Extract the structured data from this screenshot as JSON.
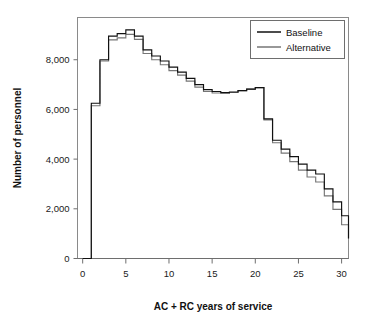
{
  "figure": {
    "clipped_title_fragment": "",
    "background_color": "#ffffff"
  },
  "colors": {
    "baseline": "#111111",
    "alternative": "#767676",
    "axis": "#6e6e6e",
    "frame": "#8a8a8a",
    "text": "#111111"
  },
  "legend": {
    "position": "top-right",
    "entries": [
      {
        "label": "Baseline",
        "color": "#111111"
      },
      {
        "label": "Alternative",
        "color": "#767676"
      }
    ]
  },
  "axes": {
    "x": {
      "label": "AC + RC years of service",
      "ticks": [
        0,
        5,
        10,
        15,
        20,
        25,
        30
      ],
      "tick_labels": [
        "0",
        "5",
        "10",
        "15",
        "20",
        "25",
        "30"
      ],
      "range": [
        -0.6,
        30.8
      ]
    },
    "y": {
      "label": "Number of personnel",
      "ticks": [
        0,
        2000,
        4000,
        6000,
        8000
      ],
      "tick_labels": [
        "0",
        "2,000",
        "4,000",
        "6,000",
        "8,000"
      ],
      "range": [
        0,
        9700
      ]
    }
  },
  "chart_data": {
    "type": "line",
    "style": "step",
    "title": "",
    "xlabel": "AC + RC years of service",
    "ylabel": "Number of personnel",
    "xlim": [
      -0.6,
      30.8
    ],
    "ylim": [
      0,
      9700
    ],
    "grid": false,
    "legend_position": "top-right",
    "x": [
      0,
      1,
      2,
      3,
      4,
      5,
      6,
      7,
      8,
      9,
      10,
      11,
      12,
      13,
      14,
      15,
      16,
      17,
      18,
      19,
      20,
      21,
      22,
      23,
      24,
      25,
      26,
      27,
      28,
      29,
      30
    ],
    "xtick_interval": 1,
    "series": [
      {
        "name": "Baseline",
        "color": "#111111",
        "values": [
          0,
          6250,
          8000,
          8950,
          9050,
          9200,
          8950,
          8400,
          8150,
          7950,
          7700,
          7500,
          7250,
          7000,
          6800,
          6720,
          6680,
          6700,
          6760,
          6820,
          6880,
          5620,
          4760,
          4400,
          4100,
          3800,
          3560,
          3400,
          2800,
          2280,
          1720
        ]
      },
      {
        "name": "Alternative",
        "color": "#767676",
        "values": [
          0,
          6150,
          7950,
          8800,
          8880,
          9020,
          8820,
          8250,
          8000,
          7800,
          7560,
          7380,
          7140,
          6900,
          6720,
          6660,
          6640,
          6680,
          6760,
          6820,
          6880,
          5580,
          4660,
          4240,
          3900,
          3560,
          3280,
          3080,
          2520,
          1980,
          1360
        ]
      }
    ],
    "tail_drop": {
      "description": "Both series drop vertically to near zero at the right edge",
      "x": 30,
      "baseline_end": 800,
      "alternative_end": 800
    },
    "notes": [
      "Step (staircase) histogram-style lines, one step per year of service",
      "Flat at 0 from year 0 to year 1, then a vertical rise",
      "Peak near 5-6 years of service at roughly 9,200 personnel",
      "Local minimum near 16 years at roughly 6,680 personnel",
      "Sharp cliff just after 20 years of service",
      "Baseline runs slightly above Alternative through most of the range"
    ]
  }
}
